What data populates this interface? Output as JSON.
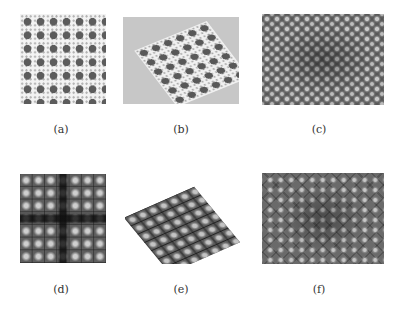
{
  "figure": {
    "panels": [
      {
        "id": "a",
        "label": "(a)",
        "description": "flat square lattice pattern, dark dots on white with small gray dots"
      },
      {
        "id": "b",
        "label": "(b)",
        "description": "tilted perspective view of lattice pattern on gray background"
      },
      {
        "id": "c",
        "label": "(c)",
        "description": "grayscale micrograph with bright spots in diagonal lattice"
      },
      {
        "id": "d",
        "label": "(d)",
        "description": "dark square grid with bright blobs"
      },
      {
        "id": "e",
        "label": "(e)",
        "description": "tilted perspective view of dark grid lattice"
      },
      {
        "id": "f",
        "label": "(f)",
        "description": "grayscale micrograph with dark diagonal grid and bright spots"
      }
    ]
  }
}
